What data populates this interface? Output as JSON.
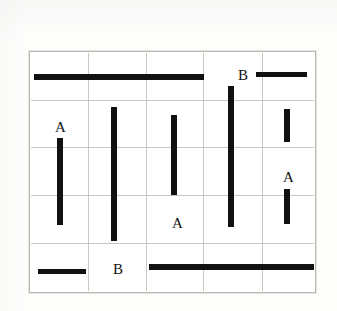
{
  "caption": {
    "full_text": "A = 2   B = 7",
    "items": [
      {
        "symbol": "A",
        "equals": "=",
        "value": "2"
      },
      {
        "symbol": "B",
        "equals": "=",
        "value": "7"
      }
    ]
  },
  "figure": {
    "type": "grid-of-line-segments",
    "colors": {
      "bar": "#111111",
      "grid_line": "#c9c7c2",
      "frame": "#b9b7b2",
      "background": "#ffffff",
      "text": "#111111"
    },
    "grid": {
      "columns": 5,
      "rows": 5,
      "x_bounds": [
        30,
        315
      ],
      "y_bounds": [
        52,
        292
      ],
      "column_edges": [
        30,
        88,
        146,
        203,
        262,
        315
      ],
      "row_edges": [
        52,
        100,
        147,
        195,
        243,
        292
      ]
    },
    "labels": [
      {
        "text": "A",
        "row": 2,
        "col": 1
      },
      {
        "text": "B",
        "row": 1,
        "col": 4
      },
      {
        "text": "A",
        "row": 3,
        "col": 5
      },
      {
        "text": "A",
        "row": 4,
        "col": 3
      },
      {
        "text": "B",
        "row": 5,
        "col": 2
      }
    ],
    "segments": [
      {
        "id": "h-row1-long",
        "orientation": "horizontal",
        "spans_columns": [
          1,
          3
        ],
        "row": 1,
        "x": 33,
        "y": 73,
        "length": 170,
        "thickness": 6
      },
      {
        "id": "h-row1-short",
        "orientation": "horizontal",
        "spans_columns": [
          5,
          5
        ],
        "row": 1,
        "x": 255,
        "y": 71,
        "length": 51,
        "thickness": 5
      },
      {
        "id": "v-col1",
        "orientation": "vertical",
        "spans_rows": [
          2,
          4
        ],
        "col": 1,
        "x": 56,
        "y": 137,
        "length": 87,
        "thickness": 6
      },
      {
        "id": "v-col2",
        "orientation": "vertical",
        "spans_rows": [
          2,
          4
        ],
        "col": 2,
        "x": 110,
        "y": 106,
        "length": 134,
        "thickness": 6
      },
      {
        "id": "v-col3",
        "orientation": "vertical",
        "spans_rows": [
          2,
          3
        ],
        "col": 3,
        "x": 170,
        "y": 114,
        "length": 80,
        "thickness": 6
      },
      {
        "id": "v-col4",
        "orientation": "vertical",
        "spans_rows": [
          1,
          4
        ],
        "col": 4,
        "x": 227,
        "y": 85,
        "length": 141,
        "thickness": 6
      },
      {
        "id": "v-col5-top",
        "orientation": "vertical",
        "spans_rows": [
          2,
          2
        ],
        "col": 5,
        "x": 283,
        "y": 108,
        "length": 33,
        "thickness": 6
      },
      {
        "id": "v-col5-bot",
        "orientation": "vertical",
        "spans_rows": [
          3,
          4
        ],
        "col": 5,
        "x": 283,
        "y": 188,
        "length": 35,
        "thickness": 6
      },
      {
        "id": "h-row5-short",
        "orientation": "horizontal",
        "spans_columns": [
          1,
          1
        ],
        "row": 5,
        "x": 37,
        "y": 268,
        "length": 48,
        "thickness": 5
      },
      {
        "id": "h-row5-long",
        "orientation": "horizontal",
        "spans_columns": [
          3,
          5
        ],
        "row": 5,
        "x": 148,
        "y": 263,
        "length": 165,
        "thickness": 6
      }
    ]
  }
}
